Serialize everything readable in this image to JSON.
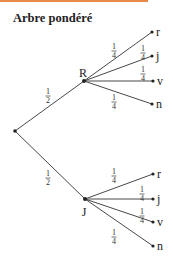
{
  "title": "Arbre pondéré",
  "accent_color": "#e8894a",
  "tree": {
    "root": {
      "x": 15,
      "y": 131
    },
    "branches": [
      {
        "node_label": "R",
        "probability": {
          "num": "1",
          "den": "2"
        },
        "node": {
          "x": 84,
          "y": 81
        },
        "label_pos": {
          "x": 83,
          "y": 77
        },
        "prob_pos": {
          "x": 48,
          "y": 96
        },
        "leaves": [
          {
            "label": "r",
            "probability": {
              "num": "1",
              "den": "4"
            },
            "pos": {
              "x": 152,
              "y": 32
            },
            "prob_pos": {
              "x": 114,
              "y": 51
            }
          },
          {
            "label": "j",
            "probability": {
              "num": "1",
              "den": "4"
            },
            "pos": {
              "x": 152,
              "y": 56
            },
            "prob_pos": {
              "x": 143,
              "y": 53
            }
          },
          {
            "label": "v",
            "probability": {
              "num": "1",
              "den": "4"
            },
            "pos": {
              "x": 153,
              "y": 81
            },
            "prob_pos": {
              "x": 143,
              "y": 74
            }
          },
          {
            "label": "n",
            "probability": {
              "num": "1",
              "den": "4"
            },
            "pos": {
              "x": 152,
              "y": 104
            },
            "prob_pos": {
              "x": 114,
              "y": 102
            }
          }
        ]
      },
      {
        "node_label": "J",
        "probability": {
          "num": "1",
          "den": "2"
        },
        "node": {
          "x": 85,
          "y": 199
        },
        "label_pos": {
          "x": 84,
          "y": 216
        },
        "prob_pos": {
          "x": 48,
          "y": 178
        },
        "leaves": [
          {
            "label": "r",
            "probability": {
              "num": "1",
              "den": "4"
            },
            "pos": {
              "x": 153,
              "y": 174
            },
            "prob_pos": {
              "x": 114,
              "y": 176
            }
          },
          {
            "label": "j",
            "probability": {
              "num": "1",
              "den": "4"
            },
            "pos": {
              "x": 153,
              "y": 199
            },
            "prob_pos": {
              "x": 142,
              "y": 194
            }
          },
          {
            "label": "v",
            "probability": {
              "num": "1",
              "den": "4"
            },
            "pos": {
              "x": 153,
              "y": 222
            },
            "prob_pos": {
              "x": 142,
              "y": 216
            }
          },
          {
            "label": "n",
            "probability": {
              "num": "1",
              "den": "4"
            },
            "pos": {
              "x": 153,
              "y": 246
            },
            "prob_pos": {
              "x": 114,
              "y": 237
            }
          }
        ]
      }
    ]
  }
}
